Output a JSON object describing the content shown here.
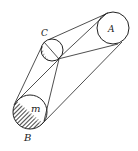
{
  "diagram": {
    "type": "geometric-construction",
    "labels": {
      "circle_a": "A",
      "circle_c": "C",
      "circle_b": "B",
      "circle_b_inner": "m"
    },
    "circles": [
      {
        "id": "A",
        "cx": 113,
        "cy": 28,
        "r": 16,
        "hatched": false
      },
      {
        "id": "C",
        "cx": 52,
        "cy": 50,
        "r": 11,
        "hatched": "left-crescent"
      },
      {
        "id": "B",
        "cx": 30,
        "cy": 112,
        "r": 17,
        "hatched": "lower-left-half"
      }
    ],
    "colors": {
      "stroke": "#222222",
      "background": "#ffffff"
    }
  }
}
